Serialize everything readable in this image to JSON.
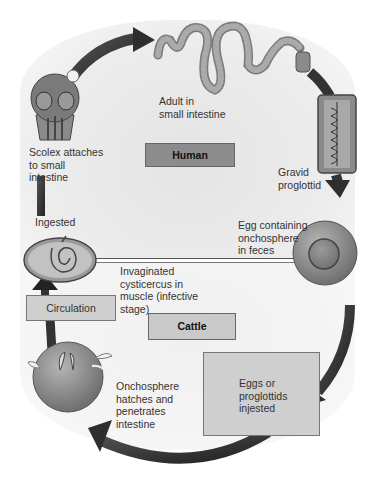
{
  "diagram": {
    "type": "life-cycle",
    "hosts": {
      "upper": "Human",
      "lower": "Cattle"
    },
    "stages": [
      {
        "id": "adult",
        "label": "Adult in\nsmall intestine"
      },
      {
        "id": "gravid",
        "label": "Gravid\nproglottid"
      },
      {
        "id": "egg",
        "label": "Egg containing\nonchosphere\nin feces"
      },
      {
        "id": "eggs_ingested",
        "label": "Eggs or\nproglottids\ninjested"
      },
      {
        "id": "onchosphere",
        "label": "Onchosphere\nhatches and\npenetrates\nintestine"
      },
      {
        "id": "circulation",
        "label": "Circulation"
      },
      {
        "id": "cysticercus",
        "label": "Invaginated\ncysticercus in\nmuscle (infective\nstage)"
      },
      {
        "id": "ingested",
        "label": "Ingested"
      },
      {
        "id": "scolex",
        "label": "Scolex attaches\nto small\nintestine"
      }
    ],
    "colors": {
      "arrow": "#2e2e2e",
      "host_box": "#8c8c8c",
      "stage_box": "#cfcfcf",
      "organism": "#8a8a8a"
    }
  }
}
